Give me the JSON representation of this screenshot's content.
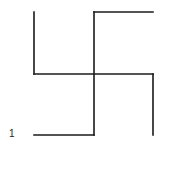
{
  "figure": {
    "label": "1",
    "stroke_color": "#1a1a1a",
    "segments": [
      {
        "name": "left-vertical",
        "x1": 34,
        "y1": 12,
        "x2": 34,
        "y2": 74
      },
      {
        "name": "middle-horizontal",
        "x1": 34,
        "y1": 74,
        "x2": 153,
        "y2": 74
      },
      {
        "name": "right-vertical",
        "x1": 153,
        "y1": 74,
        "x2": 153,
        "y2": 135
      },
      {
        "name": "top-horizontal",
        "x1": 94,
        "y1": 12,
        "x2": 153,
        "y2": 12
      },
      {
        "name": "center-vertical",
        "x1": 94,
        "y1": 12,
        "x2": 94,
        "y2": 135
      },
      {
        "name": "bottom-horizontal",
        "x1": 34,
        "y1": 135,
        "x2": 94,
        "y2": 135
      }
    ]
  }
}
